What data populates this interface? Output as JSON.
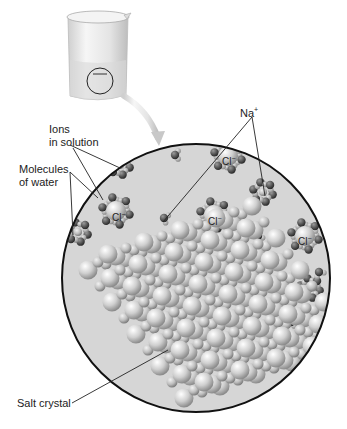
{
  "labels": {
    "ions": "Ions\nin solution",
    "molecules": "Molecules\nof water",
    "sodium": "Na",
    "sodium_charge": "+",
    "salt": "Salt crystal",
    "chloride": "Cl",
    "chloride_charge": "−"
  },
  "colors": {
    "background": "#ffffff",
    "solution": "#d6d6d6",
    "outline": "#111111",
    "beaker": "#e8e8e8",
    "arrow": "#c8c8c8",
    "ion_na": "#cfcfcf",
    "ion_cl": "#bdbdbd",
    "water_o": "#5a5a5a",
    "water_h": "#9a9a9a",
    "crystal_na": "#c4c4c4",
    "crystal_cl": "#d9d9d9"
  },
  "chloride_ions": [
    {
      "label_index": 0
    },
    {
      "label_index": 1
    },
    {
      "label_index": 2
    },
    {
      "label_index": 3
    }
  ]
}
